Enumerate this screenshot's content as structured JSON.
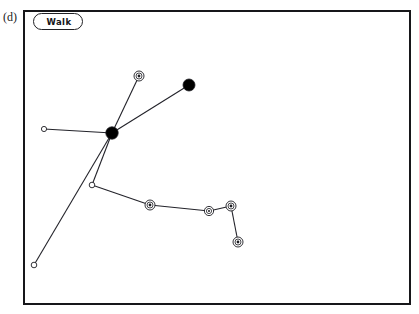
{
  "panel": {
    "caption": "(d)",
    "legend_label": "Walk",
    "frame": {
      "x": 23,
      "y": 10,
      "width": 388,
      "height": 295
    }
  },
  "colors": {
    "background": "#ffffff",
    "frame_stroke": "#17171a",
    "edge_stroke": "#23232a",
    "node_fill_solid": "#000000",
    "node_fill_open": "#ffffff",
    "node_stroke": "#1d1d22",
    "text": "#141418"
  },
  "graph": {
    "type": "node-link-skeleton",
    "nodes": [
      {
        "id": "n-hub",
        "name": "hub-node",
        "x": 112,
        "y": 133,
        "style": "solid",
        "r": 6.2
      },
      {
        "id": "n-upper-right",
        "name": "upper-right-node",
        "x": 189,
        "y": 85,
        "style": "solid",
        "r": 6.0
      },
      {
        "id": "n-top-ring",
        "name": "top-ring-node",
        "x": 139,
        "y": 76,
        "style": "ringed",
        "r": 5.0
      },
      {
        "id": "n-left-tip",
        "name": "left-tip-node",
        "x": 44,
        "y": 129,
        "style": "open",
        "r": 2.6
      },
      {
        "id": "n-junction",
        "name": "lower-junction-node",
        "x": 92,
        "y": 185,
        "style": "open",
        "r": 2.8
      },
      {
        "id": "n-bottom-left",
        "name": "bottom-left-tip-node",
        "x": 34,
        "y": 265,
        "style": "open",
        "r": 2.8
      },
      {
        "id": "n-chain-1",
        "name": "chain-ring-node-1",
        "x": 150,
        "y": 205,
        "style": "ringed",
        "r": 5.0
      },
      {
        "id": "n-chain-2",
        "name": "chain-ring-node-2",
        "x": 209,
        "y": 211,
        "style": "ringed",
        "r": 4.6
      },
      {
        "id": "n-chain-3",
        "name": "chain-ring-node-3",
        "x": 231,
        "y": 206,
        "style": "ringed",
        "r": 5.0
      },
      {
        "id": "n-chain-4",
        "name": "chain-ring-node-4",
        "x": 238,
        "y": 242,
        "style": "ringed",
        "r": 5.0
      }
    ],
    "edges": [
      {
        "name": "edge-hub-left-tip",
        "from": "n-hub",
        "to": "n-left-tip"
      },
      {
        "name": "edge-hub-top-ring",
        "from": "n-hub",
        "to": "n-top-ring"
      },
      {
        "name": "edge-hub-upper-right",
        "from": "n-hub",
        "to": "n-upper-right"
      },
      {
        "name": "edge-hub-junction",
        "from": "n-hub",
        "to": "n-junction"
      },
      {
        "name": "edge-hub-bottom-left",
        "from": "n-hub",
        "to": "n-bottom-left"
      },
      {
        "name": "edge-junction-chain-1",
        "from": "n-junction",
        "to": "n-chain-1"
      },
      {
        "name": "edge-chain-1-chain-2",
        "from": "n-chain-1",
        "to": "n-chain-2"
      },
      {
        "name": "edge-chain-2-chain-3",
        "from": "n-chain-2",
        "to": "n-chain-3"
      },
      {
        "name": "edge-chain-3-chain-4",
        "from": "n-chain-3",
        "to": "n-chain-4"
      }
    ]
  }
}
